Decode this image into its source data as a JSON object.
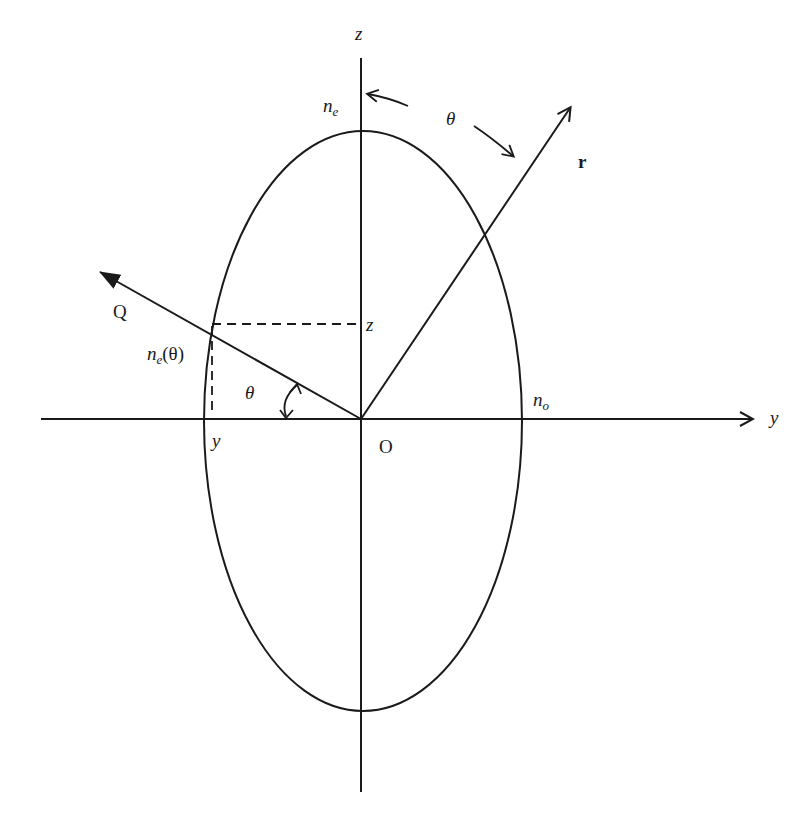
{
  "diagram": {
    "colors": {
      "ink": "#1a1a1a",
      "background": "#ffffff"
    },
    "axes": {
      "z_label": "z",
      "y_label": "y",
      "origin_label": "O"
    },
    "ellipse": {
      "top_label_main": "n",
      "top_label_sub": "e",
      "right_label_main": "n",
      "right_label_sub": "o"
    },
    "vectors": {
      "r_label": "r",
      "q_label": "Q",
      "ne_theta_main": "n",
      "ne_theta_sub": "e",
      "ne_theta_arg": "(θ)"
    },
    "angles": {
      "theta_top": "θ",
      "theta_bottom": "θ"
    },
    "projections": {
      "z_proj_label": "z",
      "y_proj_label": "y"
    }
  }
}
